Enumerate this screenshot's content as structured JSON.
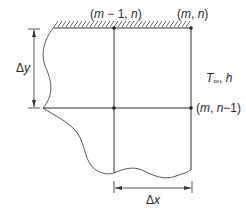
{
  "diagram": {
    "labels": {
      "node_top_left": "(m − 1, n)",
      "node_top_right": "(m, n)",
      "node_right_lower": "(m, n−1)",
      "convection": "T∞, h",
      "dx": "Δx",
      "dy": "Δy"
    },
    "label_parts": {
      "node_top_left": {
        "open": "(",
        "m": "m",
        "minus": " − 1, ",
        "n": "n",
        "close": ")"
      },
      "node_top_right": {
        "open": "(",
        "m": "m",
        "sep": ", ",
        "n": "n",
        "close": ")"
      },
      "node_right_lower": {
        "open": "(",
        "m": "m",
        "sep": ", ",
        "n": "n",
        "minus": "−1)"
      },
      "convection": {
        "T": "T",
        "sub": "∞",
        "rest": ", ",
        "h": "h"
      },
      "dx": {
        "delta": "Δ",
        "var": "x"
      },
      "dy": {
        "delta": "Δ",
        "var": "y"
      }
    },
    "elements": [
      "insulated-wall-hatching",
      "grid-line-horizontal",
      "grid-line-vertical-left",
      "grid-line-vertical-right",
      "wavy-break-boundary",
      "dimension-dx",
      "dimension-dy",
      "node-points"
    ],
    "colors": {
      "line": "#333333",
      "text": "#2a2a2a",
      "background": "#ffffff"
    }
  }
}
